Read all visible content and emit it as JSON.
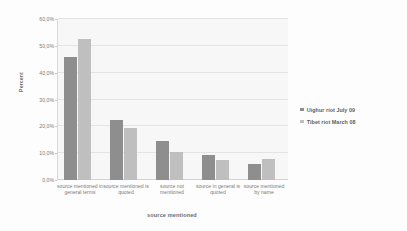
{
  "chart_data": {
    "type": "bar",
    "title": "",
    "xlabel": "source mentioned",
    "ylabel": "Percent",
    "categories": [
      "source mentioned in general terms",
      "source mentioned is quoted",
      "source not mentioned",
      "source in general is quoted",
      "source mentioned by name"
    ],
    "series": [
      {
        "name": "Uighur riot July 09",
        "color": "#8e8e8e",
        "values": [
          45.8,
          22.2,
          14.5,
          9.5,
          6.0
        ]
      },
      {
        "name": "Tibet riot March 08",
        "color": "#bfbfbf",
        "values": [
          52.7,
          19.4,
          10.3,
          7.6,
          7.7
        ]
      }
    ],
    "ylim": [
      0,
      60
    ],
    "ytick_values": [
      60,
      50,
      40,
      30,
      20,
      10,
      0
    ],
    "ytick_labels": [
      "60,0%",
      "50,0%",
      "40,0%",
      "30,0%",
      "20,0%",
      "10,0%",
      "0,0%"
    ],
    "grid": true,
    "legend_position": "right",
    "plot_background": "#f7f7f7",
    "gridline_color": "#e4e4e4"
  },
  "legend": {
    "entries": [
      {
        "label": "Uighur riot July 09"
      },
      {
        "label": "Tibet riot March 08"
      }
    ]
  }
}
